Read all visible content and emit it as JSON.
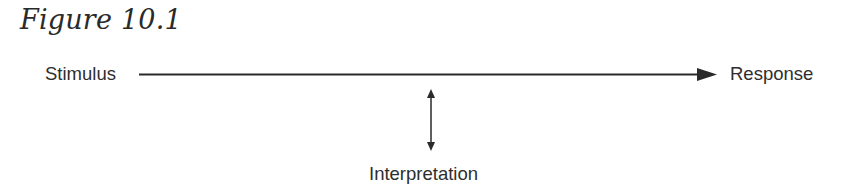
{
  "figure": {
    "title": "Figure 10.1"
  },
  "diagram": {
    "nodes": {
      "stimulus": "Stimulus",
      "response": "Response",
      "interpretation": "Interpretation"
    },
    "edges": [
      {
        "from": "Stimulus",
        "to": "Response",
        "type": "single-arrow"
      },
      {
        "from": "arrow",
        "to": "Interpretation",
        "type": "double-arrow"
      }
    ],
    "colors": {
      "ink": "#2a2a2a",
      "background": "#ffffff"
    }
  }
}
